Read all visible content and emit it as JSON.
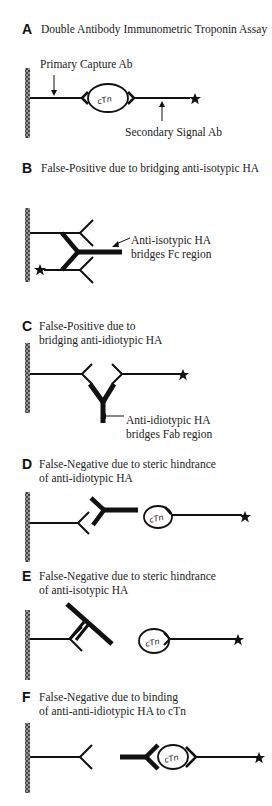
{
  "figure": {
    "panels": [
      {
        "letter": "A",
        "title_lines": [
          "Double Antibody Immunometric Troponin Assay"
        ],
        "labels": [
          "Primary Capture Ab",
          "Secondary Signal Ab"
        ]
      },
      {
        "letter": "B",
        "title_lines": [
          "False-Positive due to bridging anti-isotypic HA"
        ],
        "labels": [
          "Anti-isotypic HA",
          "bridges Fc region"
        ]
      },
      {
        "letter": "C",
        "title_lines": [
          "False-Positive due to",
          "bridging anti-idiotypic HA"
        ],
        "labels": [
          "Anti-idiotypic HA",
          "bridges Fab region"
        ]
      },
      {
        "letter": "D",
        "title_lines": [
          "False-Negative due to steric hindrance",
          "of anti-idiotypic HA"
        ],
        "labels": []
      },
      {
        "letter": "E",
        "title_lines": [
          "False-Negative due to steric hindrance",
          "of anti-isotypic HA"
        ],
        "labels": []
      },
      {
        "letter": "F",
        "title_lines": [
          "False-Negative due to binding",
          "of anti-anti-idiotypic HA to cTn"
        ],
        "labels": []
      }
    ],
    "antigen_label": "cTn",
    "colors": {
      "ink": "#111111",
      "text": "#222222",
      "background": "#ffffff"
    }
  }
}
